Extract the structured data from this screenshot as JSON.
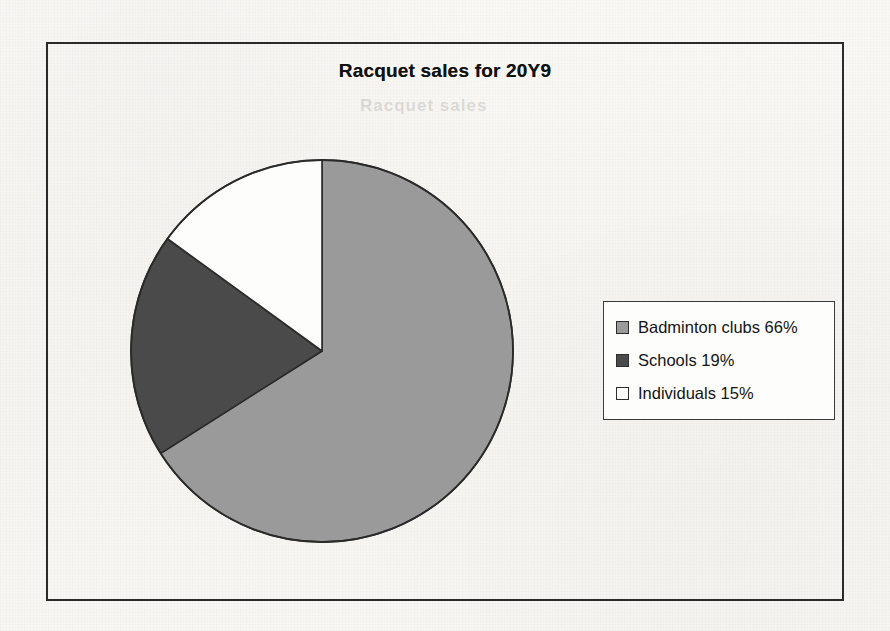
{
  "chart_data": {
    "type": "pie",
    "title": "Racquet sales for 20Y9",
    "categories": [
      "Badminton clubs",
      "Schools",
      "Individuals"
    ],
    "values": [
      66,
      19,
      15
    ],
    "value_unit": "%",
    "labels": [
      "Badminton clubs 66%",
      "Schools 19%",
      "Individuals 15%"
    ],
    "colors": [
      "#9a9a9a",
      "#4a4a4a",
      "#fdfdfb"
    ],
    "slice_border_color": "#2a2a2a",
    "start_angle_deg": 0,
    "direction": "clockwise",
    "legend_position": "right",
    "grid": false,
    "xlabel": "",
    "ylabel": ""
  },
  "frame": {
    "border_color": "#2a2a2a"
  },
  "legend": {
    "entries": [
      {
        "label": "Badminton clubs 66%",
        "color": "#9a9a9a"
      },
      {
        "label": "Schools 19%",
        "color": "#4a4a4a"
      },
      {
        "label": "Individuals 15%",
        "color": "#fdfdfb"
      }
    ]
  },
  "scan_artifacts": {
    "ghost_top": "Racquet sales",
    "ghost_mid": "clubs 66%"
  }
}
